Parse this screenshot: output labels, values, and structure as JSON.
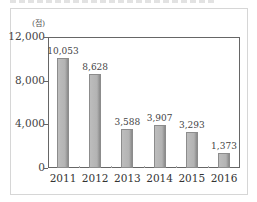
{
  "chart_data": {
    "type": "bar",
    "title": "",
    "xlabel": "",
    "ylabel": "(점)",
    "unit_label": "(점)",
    "categories": [
      "2011",
      "2012",
      "2013",
      "2014",
      "2015",
      "2016"
    ],
    "values": [
      10053,
      8628,
      3588,
      3907,
      3293,
      1373
    ],
    "value_labels": [
      "10,053",
      "8,628",
      "3,588",
      "3,907",
      "3,293",
      "1,373"
    ],
    "ylim": [
      0,
      12000
    ],
    "yticks": [
      0,
      4000,
      8000,
      12000
    ],
    "ytick_labels": [
      "0",
      "4,000",
      "8,000",
      "12,000"
    ],
    "grid": false,
    "legend": null,
    "bar_color": "#b3b3b3"
  }
}
